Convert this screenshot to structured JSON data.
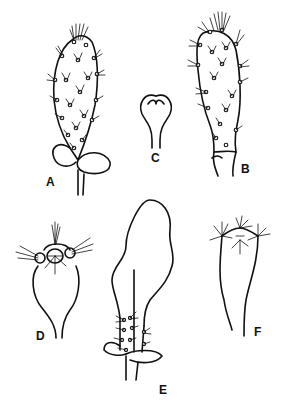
{
  "figure": {
    "type": "botanical line drawing plate",
    "colors": {
      "ink": "#111111",
      "background": "#ffffff"
    },
    "panels": [
      {
        "id": "A",
        "label": "A",
        "description": "Spiny stem segment with two basal bracts"
      },
      {
        "id": "B",
        "label": "B",
        "description": "Spiny stem segment, narrowed base"
      },
      {
        "id": "C",
        "label": "C",
        "description": "Small heart-shaped bud/fruit"
      },
      {
        "id": "D",
        "label": "D",
        "description": "Fruit with spiny apex"
      },
      {
        "id": "E",
        "label": "E",
        "description": "Large flattened segment on spiny stalk"
      },
      {
        "id": "F",
        "label": "F",
        "description": "Obconic fruit with apical spine clusters"
      }
    ]
  }
}
